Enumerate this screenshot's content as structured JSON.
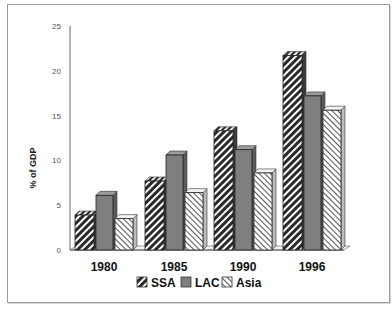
{
  "chart_data": {
    "type": "bar",
    "title": "",
    "xlabel": "",
    "ylabel": "% of GDP",
    "ylim": [
      0,
      25
    ],
    "yticks": [
      0,
      5,
      10,
      15,
      20,
      25
    ],
    "categories": [
      "1980",
      "1985",
      "1990",
      "1996"
    ],
    "series": [
      {
        "name": "SSA",
        "pattern": "dense-diagonal-dark",
        "values": [
          3.9,
          7.7,
          13.3,
          21.7
        ]
      },
      {
        "name": "LAC",
        "pattern": "solid-gray",
        "values": [
          6.1,
          10.6,
          11.2,
          17.2
        ]
      },
      {
        "name": "Asia",
        "pattern": "light-diagonal",
        "values": [
          3.5,
          6.4,
          8.6,
          15.6
        ]
      }
    ],
    "grid": false,
    "legend_position": "bottom",
    "style": "3d-bars"
  },
  "colors": {
    "ssa_dark": "#2a2a2a",
    "lac_fill": "#7f7f7f",
    "asia_line": "#444444",
    "axis": "#555555",
    "frame": "#9a9a9a"
  }
}
